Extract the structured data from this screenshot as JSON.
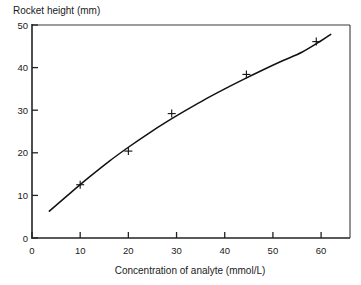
{
  "chart_data": {
    "type": "line",
    "title": "",
    "xlabel": "Concentration of analyte (mmol/L)",
    "ylabel": "Rocket height (mm)",
    "xlim": [
      0,
      66
    ],
    "ylim": [
      0,
      50
    ],
    "xticks": [
      0,
      10,
      20,
      30,
      40,
      50,
      60
    ],
    "xtick_labels": [
      "0",
      "10",
      "20",
      "30",
      "40",
      "50",
      "60"
    ],
    "yticks": [
      0,
      10,
      20,
      30,
      40,
      50
    ],
    "ytick_labels": [
      "0",
      "10",
      "20",
      "30",
      "40",
      "50"
    ],
    "grid": false,
    "legend": "none",
    "series": [
      {
        "name": "Rocket height vs concentration",
        "marker": "plus",
        "x": [
          10,
          20,
          29,
          44.5,
          59
        ],
        "values": [
          12.5,
          20.4,
          29.2,
          38.4,
          46.1
        ]
      }
    ],
    "fitted_curve": {
      "name": "calibration curve",
      "x": [
        3.6,
        8,
        12,
        16,
        20,
        24,
        28,
        32,
        36,
        40,
        44,
        48,
        52,
        56,
        60,
        62
      ],
      "y": [
        6.3,
        10.6,
        14.4,
        18.0,
        21.3,
        24.4,
        27.3,
        30.0,
        32.6,
        35.0,
        37.3,
        39.5,
        41.6,
        43.6,
        46.3,
        47.8
      ]
    },
    "colors": {
      "curve": "#111111",
      "marker": "#111111",
      "axis": "#222222",
      "frame": "#3a3a3a",
      "background": "#ffffff"
    }
  },
  "axis_titles": {
    "y": "Rocket height (mm)",
    "x": "Concentration of analyte (mmol/L)"
  }
}
